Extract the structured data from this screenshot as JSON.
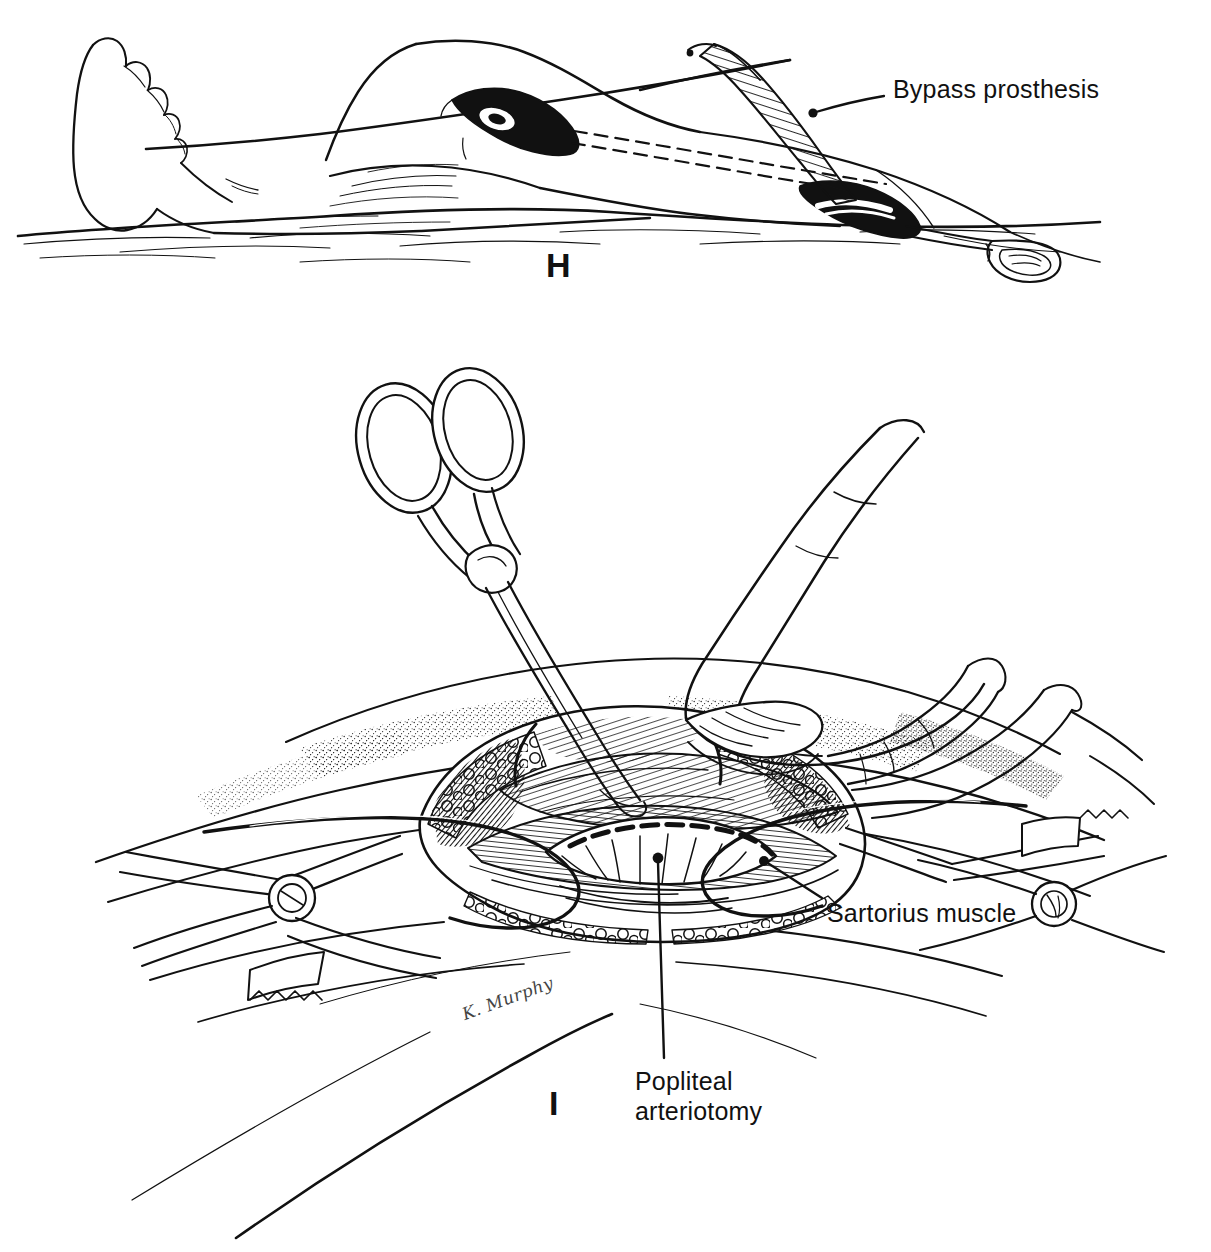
{
  "figure": {
    "medium": "pen-and-ink line drawing",
    "background_color": "#ffffff",
    "ink_color": "#111111",
    "artist_signature": "K. Murphy"
  },
  "panels": [
    {
      "letter": "H",
      "caption": "",
      "description": "Lateral view of the extended lower limb on the operating table showing the completed subcutaneous tunnel between the groin and the popliteal incisions, with the bypass prosthesis being drawn through.",
      "annotations": [
        {
          "id": "bypass-prosthesis",
          "text": "Bypass prosthesis",
          "leader": "from label left edge down-left to the ribbed graft emerging at the groin incision"
        }
      ],
      "elements": [
        "foot and lower leg resting on draped table",
        "popliteal (below-knee) incision, opened",
        "dashed subcutaneous tunnel tract",
        "groin incision",
        "ribbed bypass prosthesis",
        "tunneling instrument with long handle"
      ]
    },
    {
      "letter": "I",
      "caption": "",
      "description": "Close-up of the popliteal fossa exposure held open by self-retaining retractors; the surgeon's hand retracts tissue while a long hemostat is passed into the wound. The popliteal artery has been opened.",
      "annotations": [
        {
          "id": "sartorius-muscle",
          "text": "Sartorius muscle",
          "leader": "from label up-left with dot terminus on the retracted muscle belly"
        },
        {
          "id": "popliteal-arteriotomy",
          "text": "Popliteal\narteriotomy",
          "text_lines": [
            "Popliteal",
            "arteriotomy"
          ],
          "leader": "vertical line from label upward with dot terminus on the opened artery"
        }
      ],
      "elements": [
        "ring-handled hemostat / scissors",
        "surgeon's gloved hand",
        "self-retaining retractor (left)",
        "self-retaining retractor (right)",
        "vessel loops encircling the artery",
        "subcutaneous fat, stippled drape",
        "opened popliteal artery (arteriotomy)"
      ]
    }
  ]
}
